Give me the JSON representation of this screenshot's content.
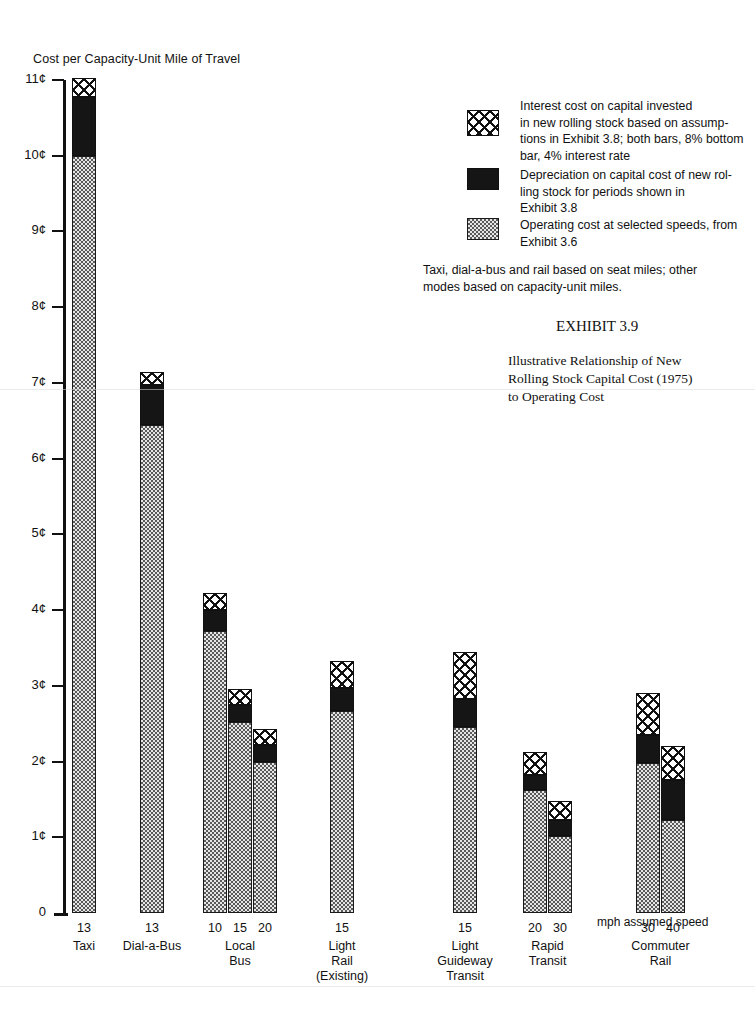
{
  "page": {
    "axis_title": "Cost per Capacity-Unit Mile of Travel",
    "mph_note": "mph assumed speed",
    "zero_label": "0"
  },
  "exhibit": {
    "number": "EXHIBIT  3.9",
    "caption": "Illustrative Relationship of New\nRolling Stock Capital Cost (1975)\nto Operating Cost"
  },
  "legend": {
    "items": [
      {
        "swatch": "crosshatch",
        "key": "interest",
        "text": "Interest cost on capital invested\nin new rolling stock based on assump-\ntions in Exhibit 3.8; both bars, 8% bottom\nbar, 4% interest rate"
      },
      {
        "swatch": "solid-black",
        "key": "depreciation",
        "text": "Depreciation on capital cost of new rol-\nling stock  for periods shown  in\nExhibit 3.8"
      },
      {
        "swatch": "stipple",
        "key": "operating",
        "text": "Operating cost at selected speeds, from\nExhibit 3.6"
      }
    ],
    "footnote": "Taxi, dial-a-bus and rail based on seat miles; other\nmodes based on capacity-unit miles."
  },
  "colors": {
    "ink": "#111111",
    "operating_fill": "#e6e6e6",
    "depreciation_fill": "#151515",
    "interest_fill": "#ffffff",
    "background": "#ffffff"
  },
  "chart_data": {
    "type": "bar",
    "subtype": "stacked-bar",
    "title": "Illustrative Relationship of New Rolling Stock Capital Cost (1975) to Operating Cost",
    "xlabel": "mph assumed speed",
    "ylabel": "Cost per Capacity-Unit Mile of Travel",
    "ylim": [
      0,
      11.2
    ],
    "y_unit": "cents",
    "y_ticks": [
      0,
      1,
      2,
      3,
      4,
      5,
      6,
      7,
      8,
      9,
      10,
      11
    ],
    "y_tick_labels": [
      "0",
      "1¢",
      "2¢",
      "3¢",
      "4¢",
      "5¢",
      "6¢",
      "7¢",
      "8¢",
      "9¢",
      "10¢",
      "11¢"
    ],
    "grid": false,
    "legend_position": "right",
    "series": [
      {
        "name": "Operating cost at selected speeds",
        "key": "operating",
        "values": [
          10.0,
          6.45,
          3.72,
          2.52,
          2.0,
          2.67,
          2.45,
          1.62,
          1.02,
          1.98,
          1.23
        ]
      },
      {
        "name": "Depreciation on capital cost of new rolling stock",
        "key": "depreciation",
        "values": [
          0.77,
          0.52,
          0.28,
          0.22,
          0.22,
          0.3,
          0.38,
          0.2,
          0.21,
          0.37,
          0.53
        ]
      },
      {
        "name": "Interest cost on capital invested in new rolling stock",
        "key": "interest",
        "values": [
          0.25,
          0.18,
          0.23,
          0.22,
          0.21,
          0.36,
          0.62,
          0.3,
          0.25,
          0.55,
          0.45
        ]
      }
    ],
    "groups": [
      {
        "mode": "Taxi",
        "mode_lines": [
          "Taxi"
        ],
        "bars": [
          {
            "speed": "13",
            "operating": 10.0,
            "depreciation": 0.77,
            "interest": 0.25,
            "total": 11.02
          }
        ]
      },
      {
        "mode": "Dial-a-Bus",
        "mode_lines": [
          "Dial-a-Bus"
        ],
        "bars": [
          {
            "speed": "13",
            "operating": 6.45,
            "depreciation": 0.52,
            "interest": 0.18,
            "total": 7.15
          }
        ]
      },
      {
        "mode": "Local Bus",
        "mode_lines": [
          "Local",
          "Bus"
        ],
        "bars": [
          {
            "speed": "10",
            "operating": 3.72,
            "depreciation": 0.28,
            "interest": 0.23,
            "total": 4.23
          },
          {
            "speed": "15",
            "operating": 2.52,
            "depreciation": 0.22,
            "interest": 0.22,
            "total": 2.96
          },
          {
            "speed": "20",
            "operating": 2.0,
            "depreciation": 0.22,
            "interest": 0.21,
            "total": 2.43
          }
        ]
      },
      {
        "mode": "Light Rail (Existing)",
        "mode_lines": [
          "Light",
          "Rail",
          "(Existing)"
        ],
        "bars": [
          {
            "speed": "15",
            "operating": 2.67,
            "depreciation": 0.3,
            "interest": 0.36,
            "total": 3.33
          }
        ]
      },
      {
        "mode": "Light Guideway Transit",
        "mode_lines": [
          "Light",
          "Guideway",
          "Transit"
        ],
        "bars": [
          {
            "speed": "15",
            "operating": 2.45,
            "depreciation": 0.38,
            "interest": 0.62,
            "total": 3.45
          }
        ]
      },
      {
        "mode": "Rapid Transit",
        "mode_lines": [
          "Rapid",
          "Transit"
        ],
        "bars": [
          {
            "speed": "20",
            "operating": 1.62,
            "depreciation": 0.2,
            "interest": 0.3,
            "total": 2.12
          },
          {
            "speed": "30",
            "operating": 1.02,
            "depreciation": 0.21,
            "interest": 0.25,
            "total": 1.48
          }
        ]
      },
      {
        "mode": "Commuter Rail",
        "mode_lines": [
          "Commuter",
          "Rail"
        ],
        "bars": [
          {
            "speed": "30",
            "operating": 1.98,
            "depreciation": 0.37,
            "interest": 0.55,
            "total": 2.9
          },
          {
            "speed": "40",
            "operating": 1.23,
            "depreciation": 0.53,
            "interest": 0.45,
            "total": 2.21
          }
        ]
      }
    ]
  },
  "layout": {
    "axis_x": 66,
    "baseline_y": 913,
    "px_per_cent": 75.73,
    "bar_width": 24,
    "bar_gap": 1,
    "group_x": [
      72,
      140,
      203,
      330,
      453,
      523,
      636
    ]
  }
}
